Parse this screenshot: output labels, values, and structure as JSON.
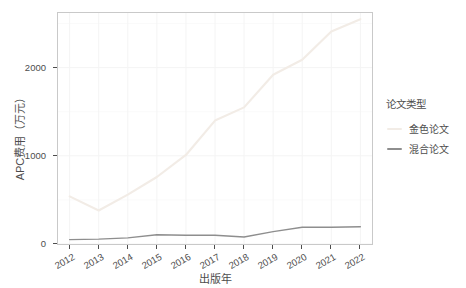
{
  "chart_data": {
    "type": "line",
    "title": "",
    "xlabel": "出版年",
    "ylabel": "APC费用（万元）",
    "categories": [
      "2012",
      "2013",
      "2014",
      "2015",
      "2016",
      "2017",
      "2018",
      "2019",
      "2020",
      "2021",
      "2022"
    ],
    "x": [
      2012,
      2013,
      2014,
      2015,
      2016,
      2017,
      2018,
      2019,
      2020,
      2021,
      2022
    ],
    "xlim": [
      2011.6,
      2022.4
    ],
    "ylim": [
      0,
      2620
    ],
    "yticks": [
      0,
      1000,
      2000
    ],
    "ytick_labels": [
      "0",
      "1000",
      "2000"
    ],
    "grid": true,
    "legend_position": "right",
    "series": [
      {
        "name": "金色论文",
        "color": "#f2ece6",
        "values": [
          540,
          380,
          560,
          760,
          1010,
          1400,
          1550,
          1920,
          2090,
          2410,
          2550
        ]
      },
      {
        "name": "混合论文",
        "color": "#8e8e8e",
        "values": [
          50,
          55,
          70,
          105,
          100,
          100,
          80,
          140,
          190,
          190,
          195
        ]
      }
    ]
  },
  "legend": {
    "title": "论文类型"
  },
  "axes": {
    "x_title": "出版年",
    "y_title": "APC费用（万元）"
  },
  "colors": {
    "gold_series": "#f2ece6",
    "hybrid_series": "#8e8e8e",
    "panel_border": "#c9c9c9",
    "grid": "#f4f4f4",
    "text": "#4d4d4d",
    "background": "#ffffff"
  }
}
